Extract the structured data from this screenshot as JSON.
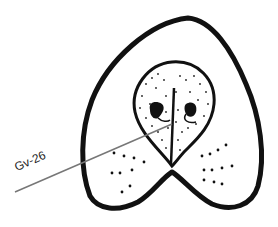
{
  "diagram": {
    "point_label": "Gv-26",
    "colors": {
      "outline": "#111111",
      "pointer_line": "#777777",
      "background": "#ffffff"
    }
  }
}
